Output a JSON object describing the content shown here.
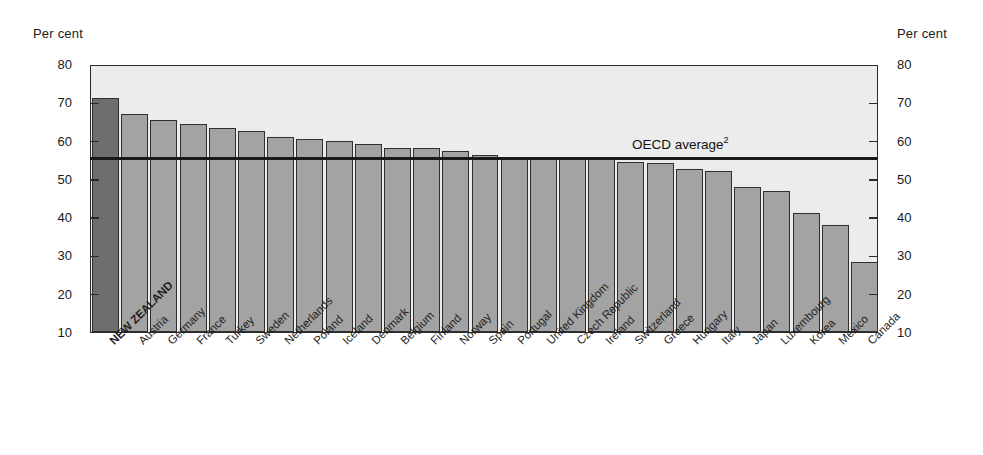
{
  "axis": {
    "unit_label_left": "Per cent",
    "unit_label_right": "Per cent",
    "ticks": [
      80,
      70,
      60,
      50,
      40,
      30,
      20,
      10
    ]
  },
  "annotation": {
    "oecd_label": "OECD average",
    "oecd_footnote": "2",
    "oecd_value": 55.6
  },
  "colors": {
    "plot_background": "#ececec",
    "bar_fill": "#a3a3a3",
    "bar_highlight_fill": "#6e6e6e",
    "bar_stroke": "#2f2f2f",
    "axis": "#2b2b2b",
    "average_line": "#1a1a1a",
    "text": "#1a1a1a"
  },
  "chart_data": {
    "type": "bar",
    "title": "",
    "subtitle": "",
    "xlabel": "",
    "ylabel": "Per cent",
    "ylim": [
      10,
      80
    ],
    "ytick_step": 10,
    "grid": false,
    "legend": "none",
    "highlight_category": "NEW ZEALAND",
    "reference_line": {
      "label": "OECD average",
      "footnote": "2",
      "value": 55.6
    },
    "categories": [
      "NEW ZEALAND",
      "Austria",
      "Germany",
      "France",
      "Turkey",
      "Sweden",
      "Netherlands",
      "Poland",
      "Iceland",
      "Denmark",
      "Belgium",
      "Finland",
      "Norway",
      "Spain",
      "Portugal",
      "United Kingdom",
      "Czech Republic",
      "Ireland",
      "Switzerland",
      "Greece",
      "Hungary",
      "Italy",
      "Japan",
      "Luxembourg",
      "Korea",
      "Mexico",
      "Canada"
    ],
    "values": [
      71.2,
      67.0,
      65.3,
      64.3,
      63.2,
      62.5,
      60.9,
      60.5,
      60.0,
      59.2,
      58.1,
      58.0,
      57.2,
      56.3,
      55.6,
      55.6,
      55.6,
      55.6,
      54.4,
      54.2,
      52.6,
      52.1,
      47.9,
      46.9,
      41.0,
      38.0,
      28.3
    ]
  }
}
